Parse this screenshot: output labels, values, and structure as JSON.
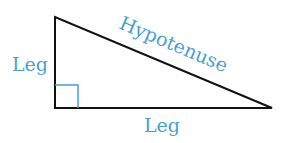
{
  "diagram": {
    "type": "right-triangle",
    "labels": {
      "hypotenuse": "Hypotenuse",
      "vertical_leg": "Leg",
      "horizontal_leg": "Leg"
    },
    "colors": {
      "line": "#111111",
      "label": "#4a9fd0",
      "right_angle_marker": "#4a9fd0"
    }
  }
}
